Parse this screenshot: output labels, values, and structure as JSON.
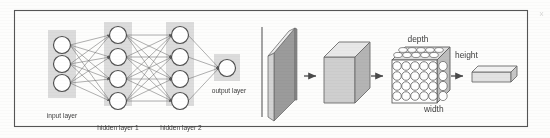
{
  "figure": {
    "background_color": "#fdfdfc",
    "frame_color": "#555555",
    "divider_color": "#6a6a6a",
    "ink_color": "#4a4a4a",
    "label_color": "#3d3d3d",
    "band_color": "#dcdcdc",
    "node_fill": "#ffffff",
    "node_stroke": "#4f4f4f",
    "slab_dark": "#9b9b9b",
    "slab_light": "#d8d8d8",
    "slab_top": "#efefef",
    "cube_front": "#cfcfcf",
    "cube_top": "#e8e8e8",
    "cube_side": "#b4b4b4"
  },
  "left_panel": {
    "name": "multilayer-perceptron",
    "layers": [
      {
        "id": "input",
        "label": "input layer",
        "nodes": 3,
        "x": 62,
        "band_x": 48,
        "band_y": 30,
        "band_w": 28,
        "band_h": 68,
        "node_y": [
          45,
          64,
          83
        ]
      },
      {
        "id": "hidden1",
        "label": "hidden layer 1",
        "nodes": 4,
        "x": 118,
        "band_x": 104,
        "band_y": 22,
        "band_w": 28,
        "band_h": 84,
        "node_y": [
          35,
          57,
          79,
          101
        ]
      },
      {
        "id": "hidden2",
        "label": "hidden layer 2",
        "nodes": 4,
        "x": 180,
        "band_x": 166,
        "band_y": 22,
        "band_w": 28,
        "band_h": 84,
        "node_y": [
          35,
          57,
          79,
          101
        ]
      },
      {
        "id": "output",
        "label": "output layer",
        "nodes": 1,
        "x": 227,
        "band_x": 214,
        "band_y": 54,
        "band_w": 26,
        "band_h": 26,
        "node_y": [
          68
        ]
      }
    ],
    "labels": [
      {
        "text": "input layer",
        "x": 62,
        "y": 118,
        "anchor": "middle"
      },
      {
        "text": "hidden layer 1",
        "x": 118,
        "y": 130,
        "anchor": "middle"
      },
      {
        "text": "hidden layer 2",
        "x": 181,
        "y": 130,
        "anchor": "middle"
      },
      {
        "text": "output layer",
        "x": 229,
        "y": 92,
        "anchor": "middle"
      }
    ],
    "node_radius": 8.5
  },
  "right_panel": {
    "name": "convolutional-volume-pipeline",
    "divider": {
      "x": 262,
      "y1": 27,
      "y2": 117
    },
    "stages": [
      {
        "id": "input-slab",
        "type": "thin-slab",
        "label": ""
      },
      {
        "id": "conv-cube",
        "type": "cube",
        "label": ""
      },
      {
        "id": "neuron-volume",
        "type": "neuron-grid",
        "label": "",
        "grid_cols": 5,
        "grid_rows": 4
      },
      {
        "id": "output-vector",
        "type": "flat-bar",
        "label": ""
      }
    ],
    "dimension_labels": [
      {
        "text": "depth",
        "x": 418,
        "y": 40,
        "anchor": "middle"
      },
      {
        "text": "height",
        "x": 472,
        "y": 60,
        "anchor": "start"
      },
      {
        "text": "width",
        "x": 455,
        "y": 113,
        "anchor": "start"
      }
    ],
    "arrows": [
      {
        "id": "arrow-slab-to-cube",
        "x": 310,
        "y": 76
      },
      {
        "id": "arrow-cube-to-volume",
        "x": 377,
        "y": 76
      },
      {
        "id": "arrow-volume-to-out",
        "x": 457,
        "y": 76
      }
    ]
  }
}
